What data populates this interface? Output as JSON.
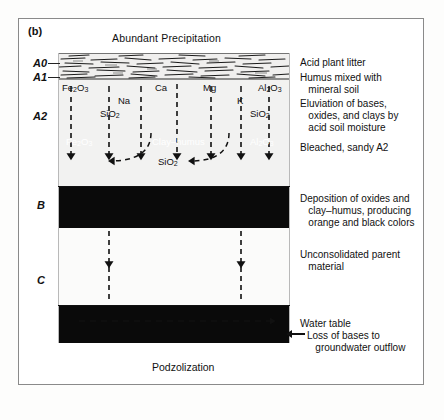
{
  "figure": {
    "panel_letter": "(b)",
    "title": "Abundant Precipitation",
    "caption": "Podzolization"
  },
  "horizons": [
    {
      "id": "A0",
      "label": "A0",
      "note": "Acid plant litter"
    },
    {
      "id": "A1",
      "label": "A1",
      "note": "Humus mixed with\n   mineral soil"
    },
    {
      "id": "A2",
      "label": "A2",
      "note_top": "Eluviation of bases,\n   oxides, and clays by\n   acid soil moisture",
      "note_bottom": "Bleached, sandy A2"
    },
    {
      "id": "B",
      "label": "B",
      "note": "Deposition of oxides and\n   clay–humus, producing\n   orange and black colors"
    },
    {
      "id": "C",
      "label": "C",
      "note": "Unconsolidated parent\n   material"
    }
  ],
  "notes": {
    "acid_litter": "Acid plant litter",
    "humus": "Humus mixed with\n   mineral soil",
    "eluviation": "Eluviation of bases,\n   oxides, and clays by\n   acid soil moisture",
    "bleached": "Bleached, sandy A2",
    "deposition": "Deposition of oxides and\n   clay–humus, producing\n   orange and black colors",
    "parent_material": "Unconsolidated parent\n   material",
    "water_table": "Water table",
    "loss_of_bases": "Loss of bases to\n   groundwater outflow"
  },
  "leaching_labels": [
    {
      "text": "Fe2O3",
      "x": 62,
      "y": 86
    },
    {
      "text": "SiO2",
      "x": 100,
      "y": 111
    },
    {
      "text": "Na",
      "x": 118,
      "y": 99
    },
    {
      "text": "Ca",
      "x": 155,
      "y": 86
    },
    {
      "text": "Mg",
      "x": 203,
      "y": 86
    },
    {
      "text": "K",
      "x": 235,
      "y": 99
    },
    {
      "text": "SiO2",
      "x": 248,
      "y": 111
    },
    {
      "text": "Al2O3",
      "x": 258,
      "y": 86
    }
  ],
  "arc_label": "SiO2",
  "b_horizon_labels": {
    "left": "Fe2O3",
    "center": "Clay–humus",
    "right": "Al2O3"
  },
  "colors": {
    "b_horizon": "#0a0a0a",
    "water_table": "#0a0a0a",
    "a2_horizon": "#f2f2f1",
    "c_horizon": "#fbfbfa",
    "frame": "#8a8a8a",
    "ink": "#111111"
  }
}
